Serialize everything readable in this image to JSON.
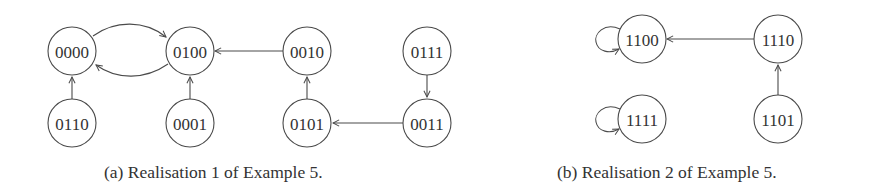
{
  "figure": {
    "colors": {
      "stroke": "#4a4a4a",
      "text": "#333333",
      "background": "#ffffff"
    },
    "subfigures": [
      {
        "id": "a",
        "caption": "(a) Realisation 1 of Example 5.",
        "nodes": [
          {
            "label": "0000",
            "cx": 72,
            "cy": 51
          },
          {
            "label": "0100",
            "cx": 190,
            "cy": 51
          },
          {
            "label": "0010",
            "cx": 307,
            "cy": 51
          },
          {
            "label": "0111",
            "cx": 427,
            "cy": 51
          },
          {
            "label": "0110",
            "cx": 72,
            "cy": 123
          },
          {
            "label": "0001",
            "cx": 190,
            "cy": 123
          },
          {
            "label": "0101",
            "cx": 307,
            "cy": 123
          },
          {
            "label": "0011",
            "cx": 427,
            "cy": 123
          }
        ],
        "edges": [
          {
            "from": "0000",
            "to": "0100",
            "shape": "curved-top"
          },
          {
            "from": "0100",
            "to": "0000",
            "shape": "curved-bottom"
          },
          {
            "from": "0010",
            "to": "0100",
            "shape": "straight"
          },
          {
            "from": "0110",
            "to": "0000",
            "shape": "straight"
          },
          {
            "from": "0001",
            "to": "0100",
            "shape": "straight"
          },
          {
            "from": "0101",
            "to": "0010",
            "shape": "straight"
          },
          {
            "from": "0111",
            "to": "0011",
            "shape": "straight"
          },
          {
            "from": "0011",
            "to": "0101",
            "shape": "straight"
          }
        ]
      },
      {
        "id": "b",
        "caption": "(b) Realisation 2 of Example 5.",
        "nodes": [
          {
            "label": "1100",
            "cx": 642,
            "cy": 39
          },
          {
            "label": "1110",
            "cx": 778,
            "cy": 39
          },
          {
            "label": "1111",
            "cx": 642,
            "cy": 119
          },
          {
            "label": "1101",
            "cx": 778,
            "cy": 119
          }
        ],
        "edges": [
          {
            "from": "1100",
            "to": "1100",
            "shape": "self-loop"
          },
          {
            "from": "1110",
            "to": "1100",
            "shape": "straight"
          },
          {
            "from": "1111",
            "to": "1111",
            "shape": "self-loop"
          },
          {
            "from": "1101",
            "to": "1110",
            "shape": "straight"
          }
        ]
      }
    ]
  }
}
